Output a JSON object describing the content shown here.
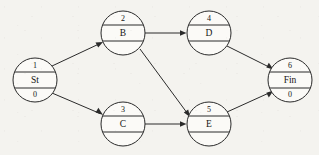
{
  "diagram": {
    "type": "activity-network-diagram",
    "canvas": {
      "width": 319,
      "height": 155,
      "background": "#f4f3ef"
    },
    "style": {
      "node_fill": "#fbfaf7",
      "node_stroke": "#2a2a2a",
      "edge_stroke": "#2a2a2a",
      "text_color": "#151515",
      "node_radius": 22,
      "divider_offset": 8
    },
    "nodes": [
      {
        "key": "st",
        "id": "1",
        "label": "St",
        "value": "0",
        "cx": 35,
        "cy": 80
      },
      {
        "key": "b",
        "id": "2",
        "label": "B",
        "value": "",
        "cx": 123,
        "cy": 33
      },
      {
        "key": "c",
        "id": "3",
        "label": "C",
        "value": "",
        "cx": 123,
        "cy": 124
      },
      {
        "key": "d",
        "id": "4",
        "label": "D",
        "value": "",
        "cx": 209,
        "cy": 33
      },
      {
        "key": "e",
        "id": "5",
        "label": "E",
        "value": "",
        "cx": 209,
        "cy": 124
      },
      {
        "key": "fin",
        "id": "6",
        "label": "Fin",
        "value": "0",
        "cx": 290,
        "cy": 80
      }
    ],
    "edges": [
      {
        "key": "st-b",
        "from": "1",
        "to": "2",
        "from_label": "St",
        "to_label": "B",
        "x1": 52,
        "y1": 66,
        "x2": 103,
        "y2": 42
      },
      {
        "key": "st-c",
        "from": "1",
        "to": "3",
        "from_label": "St",
        "to_label": "C",
        "x1": 52,
        "y1": 93,
        "x2": 103,
        "y2": 115
      },
      {
        "key": "b-d",
        "from": "2",
        "to": "4",
        "from_label": "B",
        "to_label": "D",
        "x1": 145,
        "y1": 33,
        "x2": 186,
        "y2": 33
      },
      {
        "key": "b-e",
        "from": "2",
        "to": "5",
        "from_label": "B",
        "to_label": "E",
        "x1": 140,
        "y1": 49,
        "x2": 190,
        "y2": 116
      },
      {
        "key": "c-e",
        "from": "3",
        "to": "5",
        "from_label": "C",
        "to_label": "E",
        "x1": 145,
        "y1": 124,
        "x2": 186,
        "y2": 124
      },
      {
        "key": "d-fin",
        "from": "4",
        "to": "6",
        "from_label": "D",
        "to_label": "Fin",
        "x1": 227,
        "y1": 46,
        "x2": 273,
        "y2": 69
      },
      {
        "key": "e-fin",
        "from": "5",
        "to": "6",
        "from_label": "E",
        "to_label": "Fin",
        "x1": 227,
        "y1": 112,
        "x2": 273,
        "y2": 91
      }
    ]
  }
}
